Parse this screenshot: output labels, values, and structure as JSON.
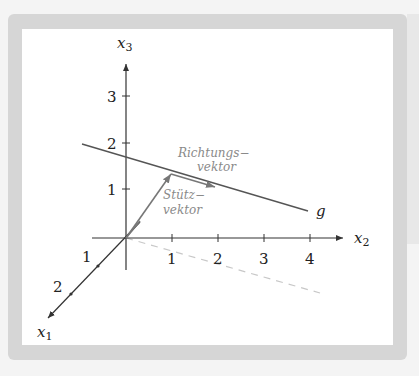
{
  "figure": {
    "axes": {
      "x1": {
        "label": "x",
        "subscript": "1",
        "ticks": [
          "1",
          "2"
        ]
      },
      "x2": {
        "label": "x",
        "subscript": "2",
        "ticks": [
          "1",
          "2",
          "3",
          "4"
        ]
      },
      "x3": {
        "label": "x",
        "subscript": "3",
        "ticks": [
          "1",
          "2",
          "3"
        ]
      }
    },
    "line": {
      "label": "g"
    },
    "vectors": {
      "support": {
        "line1": "Stütz−",
        "line2": "vektor"
      },
      "direction": {
        "line1": "Richtungs−",
        "line2": "vektor"
      }
    },
    "colors": {
      "axis": "#333333",
      "line": "#555555",
      "vector": "#777777",
      "annotation": "#8a8a8a",
      "frame": "#d6d6d6"
    }
  }
}
